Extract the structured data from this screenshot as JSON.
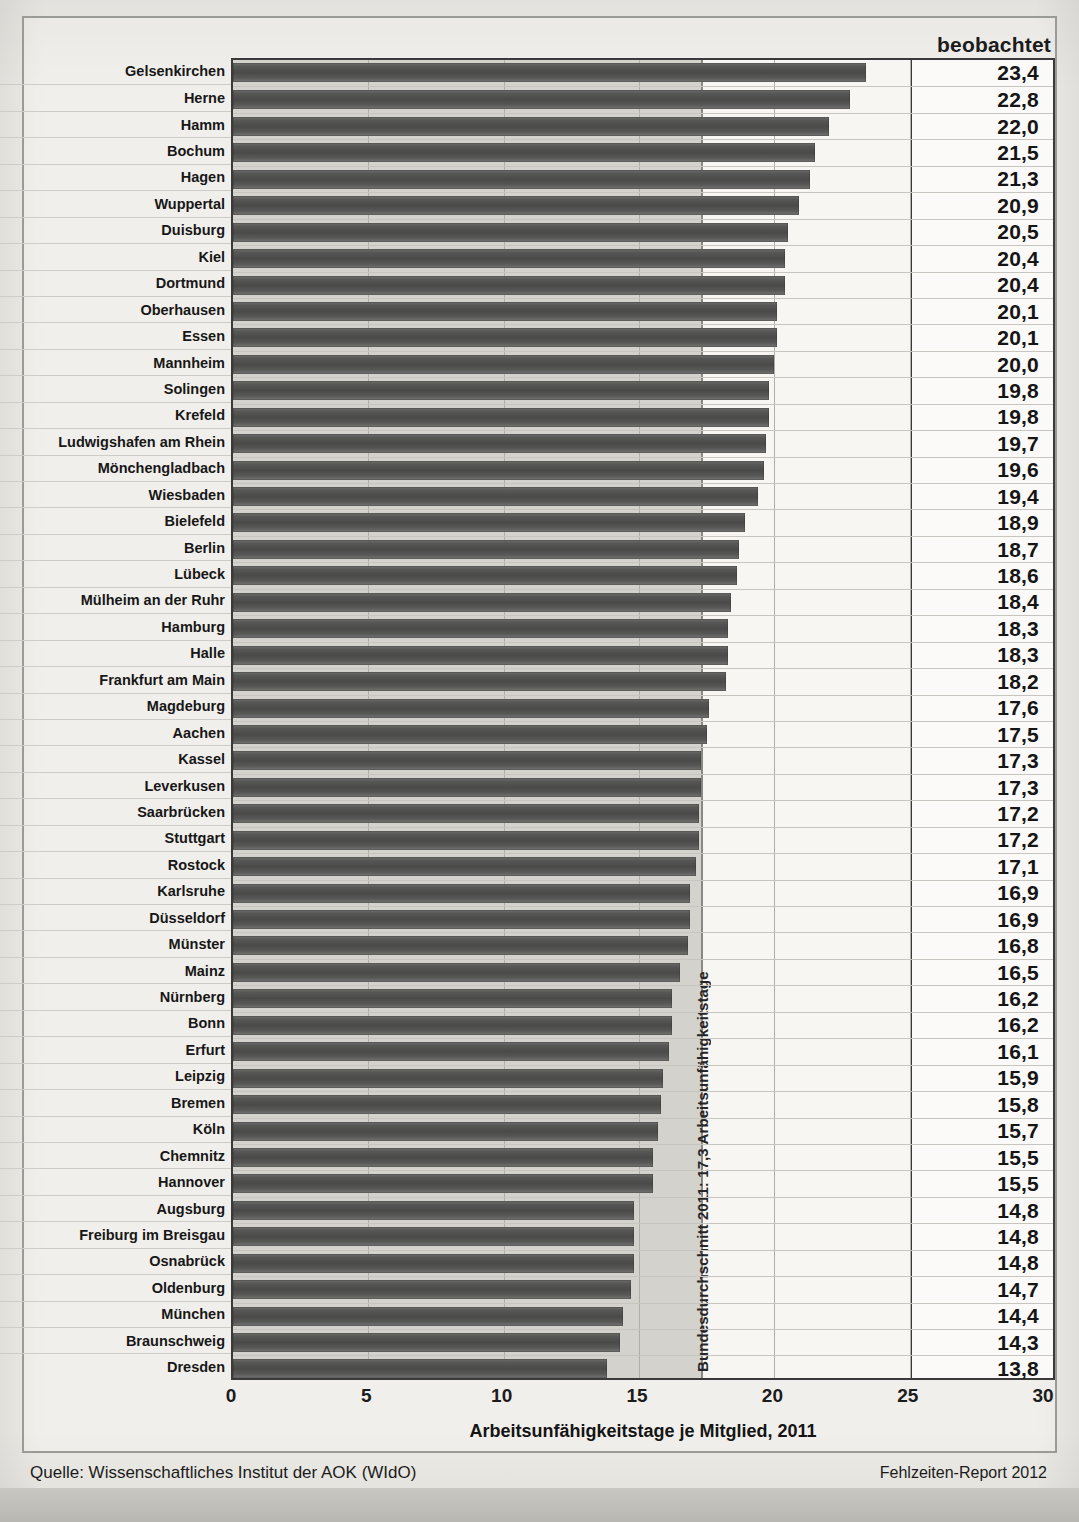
{
  "header": {
    "column_header": "beobachtet"
  },
  "axis": {
    "ticks": [
      "0",
      "5",
      "10",
      "15",
      "20",
      "25",
      "30"
    ],
    "tick_values": [
      0,
      5,
      10,
      15,
      20,
      25,
      30
    ],
    "xlabel": "Arbeitsunfähigkeitstage je Mitglied, 2011"
  },
  "annotation": {
    "average_label": "Bundesdurchschnitt 2011: 17,3 Arbeitsunfähigkeitstage",
    "average_value": 17.3
  },
  "footer": {
    "source": "Quelle: Wissenschaftliches Institut der AOK (WIdO)",
    "report": "Fehlzeiten-Report 2012"
  },
  "chart_data": {
    "type": "bar",
    "orientation": "horizontal",
    "title": "",
    "xlabel": "Arbeitsunfähigkeitstage je Mitglied, 2011",
    "ylabel": "",
    "xlim": [
      0,
      30
    ],
    "grid": true,
    "legend": "none",
    "value_column_header": "beobachtet",
    "reference_line": {
      "label": "Bundesdurchschnitt 2011: 17,3 Arbeitsunfähigkeitstage",
      "value": 17.3
    },
    "categories": [
      "Gelsenkirchen",
      "Herne",
      "Hamm",
      "Bochum",
      "Hagen",
      "Wuppertal",
      "Duisburg",
      "Kiel",
      "Dortmund",
      "Oberhausen",
      "Essen",
      "Mannheim",
      "Solingen",
      "Krefeld",
      "Ludwigshafen am Rhein",
      "Mönchengladbach",
      "Wiesbaden",
      "Bielefeld",
      "Berlin",
      "Lübeck",
      "Mülheim an der Ruhr",
      "Hamburg",
      "Halle",
      "Frankfurt am Main",
      "Magdeburg",
      "Aachen",
      "Kassel",
      "Leverkusen",
      "Saarbrücken",
      "Stuttgart",
      "Rostock",
      "Karlsruhe",
      "Düsseldorf",
      "Münster",
      "Mainz",
      "Nürnberg",
      "Bonn",
      "Erfurt",
      "Leipzig",
      "Bremen",
      "Köln",
      "Chemnitz",
      "Hannover",
      "Augsburg",
      "Freiburg im Breisgau",
      "Osnabrück",
      "Oldenburg",
      "München",
      "Braunschweig",
      "Dresden"
    ],
    "values": [
      23.4,
      22.8,
      22.0,
      21.5,
      21.3,
      20.9,
      20.5,
      20.4,
      20.4,
      20.1,
      20.1,
      20.0,
      19.8,
      19.8,
      19.7,
      19.6,
      19.4,
      18.9,
      18.7,
      18.6,
      18.4,
      18.3,
      18.3,
      18.2,
      17.6,
      17.5,
      17.3,
      17.3,
      17.2,
      17.2,
      17.1,
      16.9,
      16.9,
      16.8,
      16.5,
      16.2,
      16.2,
      16.1,
      15.9,
      15.8,
      15.7,
      15.5,
      15.5,
      14.8,
      14.8,
      14.8,
      14.7,
      14.4,
      14.3,
      13.8
    ],
    "value_labels": [
      "23,4",
      "22,8",
      "22,0",
      "21,5",
      "21,3",
      "20,9",
      "20,5",
      "20,4",
      "20,4",
      "20,1",
      "20,1",
      "20,0",
      "19,8",
      "19,8",
      "19,7",
      "19,6",
      "19,4",
      "18,9",
      "18,7",
      "18,6",
      "18,4",
      "18,3",
      "18,3",
      "18,2",
      "17,6",
      "17,5",
      "17,3",
      "17,3",
      "17,2",
      "17,2",
      "17,1",
      "16,9",
      "16,9",
      "16,8",
      "16,5",
      "16,2",
      "16,2",
      "16,1",
      "15,9",
      "15,8",
      "15,7",
      "15,5",
      "15,5",
      "14,8",
      "14,8",
      "14,8",
      "14,7",
      "14,4",
      "14,3",
      "13,8"
    ]
  },
  "colors": {
    "bar": "#4a4a49",
    "shade": "#d4d2cd",
    "frame": "#3a3a3a",
    "page": "#edebe6"
  }
}
